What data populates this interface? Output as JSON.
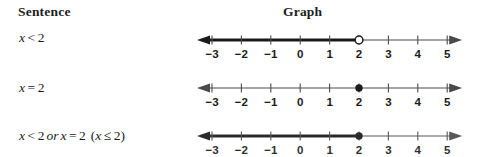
{
  "headers": {
    "sentence": "Sentence",
    "graph": "Graph"
  },
  "rows": [
    {
      "sentence": {
        "lhs": "x",
        "op": "<",
        "rhs": "2",
        "plain": "x < 2"
      },
      "graph": {
        "point_at": 2,
        "point_style": "open",
        "ray_direction": "left",
        "ray_bold": true,
        "left_arrow": true,
        "right_arrow": true
      }
    },
    {
      "sentence": {
        "lhs": "x",
        "op": "=",
        "rhs": "2",
        "plain": "x = 2"
      },
      "graph": {
        "point_at": 2,
        "point_style": "closed",
        "ray_direction": "none",
        "ray_bold": false,
        "left_arrow": true,
        "right_arrow": true
      }
    },
    {
      "sentence": {
        "lhs": "x",
        "op": "<",
        "rhs": "2",
        "connector": "or",
        "lhs2": "x",
        "op2": "=",
        "rhs2": "2",
        "paren_open": "(",
        "lhs3": "x",
        "op3": "≤",
        "rhs3": "2",
        "paren_close": ")",
        "plain": "x < 2 or x = 2 (x ≤ 2)"
      },
      "graph": {
        "point_at": 2,
        "point_style": "closed",
        "ray_direction": "left",
        "ray_bold": true,
        "left_arrow": true,
        "right_arrow": true
      }
    }
  ],
  "axis": {
    "ticks": [
      -3,
      -2,
      -1,
      0,
      1,
      2,
      3,
      4,
      5
    ],
    "tick_labels": [
      "−3",
      "−2",
      "−1",
      "0",
      "1",
      "2",
      "3",
      "4",
      "5"
    ],
    "min": -3,
    "max": 5
  },
  "colors": {
    "ink": "#1b1b1b",
    "axis": "#4a4a4a",
    "bold_ray": "#1a1a1a",
    "background": "#ffffff"
  }
}
